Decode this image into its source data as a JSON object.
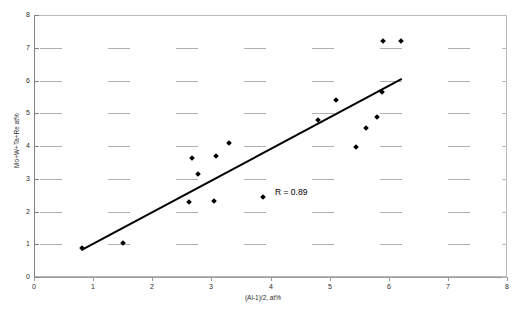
{
  "chart_data": {
    "type": "scatter",
    "title": "",
    "xlabel": "(Al-1)/2, at%",
    "ylabel": "Mo+W+Ta+Re at%",
    "xlim": [
      0,
      8
    ],
    "ylim": [
      0,
      8
    ],
    "xticks": [
      0,
      1,
      2,
      3,
      4,
      5,
      6,
      7,
      8
    ],
    "yticks": [
      0,
      1,
      2,
      3,
      4,
      5,
      6,
      7,
      8
    ],
    "xtick_labels": [
      "0",
      "1",
      "2",
      "3",
      "4",
      "5",
      "6",
      "7",
      "8"
    ],
    "ytick_labels": [
      "0",
      "1",
      "2",
      "3",
      "4",
      "5",
      "6",
      "7",
      "8"
    ],
    "grid": "dashed-horizontal-segments",
    "legend": "none",
    "marker": "filled-diamond",
    "marker_color": "#000000",
    "points": [
      {
        "x": 0.82,
        "y": 0.88
      },
      {
        "x": 1.5,
        "y": 1.05
      },
      {
        "x": 2.62,
        "y": 2.28
      },
      {
        "x": 2.67,
        "y": 3.62
      },
      {
        "x": 2.78,
        "y": 3.15
      },
      {
        "x": 3.05,
        "y": 2.32
      },
      {
        "x": 3.08,
        "y": 3.7
      },
      {
        "x": 3.3,
        "y": 4.1
      },
      {
        "x": 3.88,
        "y": 2.45
      },
      {
        "x": 4.8,
        "y": 4.8
      },
      {
        "x": 5.1,
        "y": 5.4
      },
      {
        "x": 5.45,
        "y": 3.98
      },
      {
        "x": 5.62,
        "y": 4.55
      },
      {
        "x": 5.8,
        "y": 4.88
      },
      {
        "x": 5.88,
        "y": 5.65
      },
      {
        "x": 5.9,
        "y": 7.22
      },
      {
        "x": 6.2,
        "y": 7.2
      }
    ],
    "trendline": {
      "type": "linear-fit",
      "x_start": 0.8,
      "y_start": 0.82,
      "x_end": 6.22,
      "y_end": 6.05,
      "color": "#000000",
      "width": 2
    },
    "annotations": [
      {
        "text": "R = 0.89",
        "x": 4.55,
        "y": 2.6
      }
    ]
  }
}
